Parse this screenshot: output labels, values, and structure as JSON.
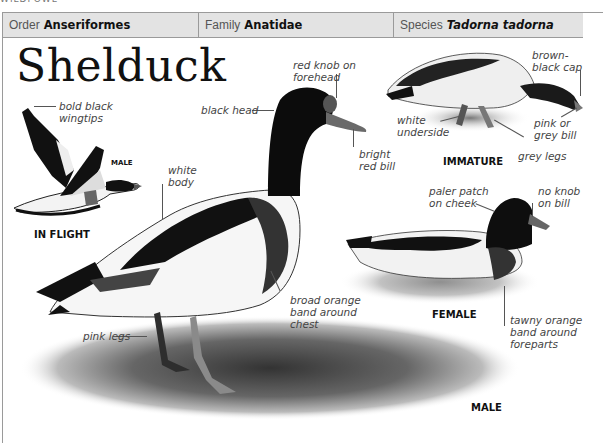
{
  "running_header": "WILDFOWL",
  "taxonomy": {
    "order": {
      "label": "Order",
      "value": "Anseriformes"
    },
    "family": {
      "label": "Family",
      "value": "Anatidae"
    },
    "species": {
      "label": "Species",
      "value": "Tadorna tadorna"
    }
  },
  "title": "Shelduck",
  "captions": {
    "in_flight": "IN FLIGHT",
    "flight_male": "MALE",
    "male": "MALE",
    "female": "FEMALE",
    "immature": "IMMATURE"
  },
  "annotations": {
    "flight_wingtips": [
      "bold black",
      "wingtips"
    ],
    "white_body": [
      "white",
      "body"
    ],
    "black_head": [
      "black head"
    ],
    "red_knob": [
      "red knob on",
      "forehead"
    ],
    "bright_red_bill": [
      "bright",
      "red bill"
    ],
    "broad_band": [
      "broad orange",
      "band around",
      "chest"
    ],
    "pink_legs": [
      "pink legs"
    ],
    "imm_cap": [
      "brown-",
      "black cap"
    ],
    "imm_underside": [
      "white",
      "underside"
    ],
    "imm_bill": [
      "pink or",
      "grey bill"
    ],
    "imm_legs": [
      "grey legs"
    ],
    "fem_cheek": [
      "paler patch",
      "on cheek"
    ],
    "fem_knob": [
      "no knob",
      "on bill"
    ],
    "fem_band": [
      "tawny orange",
      "band around",
      "foreparts"
    ]
  }
}
